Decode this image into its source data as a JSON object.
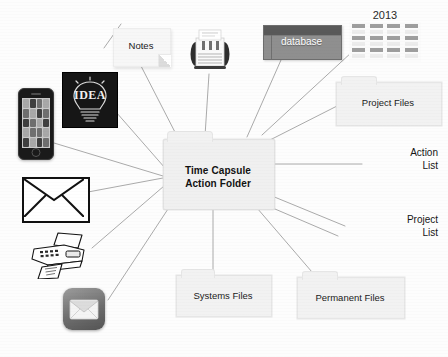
{
  "diagram": {
    "title": "Time Capsule Action Folder",
    "background_color": "#fdfdfd",
    "edge_color": "#9a9a9a",
    "center": {
      "label_line1": "Time Capsule",
      "label_line2": "Action Folder",
      "shape": "folder",
      "fill_color": "#f0f0f0"
    },
    "inputs": [
      {
        "id": "notes",
        "name": "sticky-note",
        "label": "Notes",
        "shape": "sticky-note"
      },
      {
        "id": "rolodex",
        "name": "card-file",
        "label": "",
        "shape": "photo"
      },
      {
        "id": "database",
        "name": "database",
        "label": "database",
        "shape": "window",
        "fill_color": "#8f8f8f",
        "text_color": "#ffffff"
      },
      {
        "id": "calendar",
        "name": "calendar",
        "label": "2013",
        "shape": "calendar"
      },
      {
        "id": "idea",
        "name": "idea-bulb",
        "label": "IDEA",
        "shape": "photo",
        "fill_color": "#161616"
      },
      {
        "id": "iphone",
        "name": "smartphone",
        "label": "",
        "shape": "photo"
      },
      {
        "id": "envelope",
        "name": "envelope",
        "label": "",
        "shape": "line-art"
      },
      {
        "id": "fax",
        "name": "fax-machine",
        "label": "",
        "shape": "line-art"
      },
      {
        "id": "mailapp",
        "name": "mail-app",
        "label": "",
        "shape": "app-icon"
      }
    ],
    "outputs": [
      {
        "id": "project_files",
        "label": "Project Files",
        "shape": "folder"
      },
      {
        "id": "action_list",
        "label_line1": "Action",
        "label_line2": "List",
        "shape": "text"
      },
      {
        "id": "project_list",
        "label_line1": "Project",
        "label_line2": "List",
        "shape": "text"
      },
      {
        "id": "permanent_files",
        "label": "Permanent Files",
        "shape": "folder"
      },
      {
        "id": "systems_files",
        "label": "Systems Files",
        "shape": "folder"
      }
    ],
    "calendar_year": "2013"
  }
}
